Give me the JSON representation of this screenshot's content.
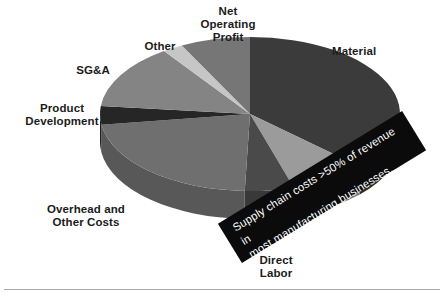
{
  "chart_data": {
    "type": "pie",
    "title": "",
    "style": "3d-pie",
    "callout": "Supply chain costs >50% of revenue in\nmost manufacturing businesses.",
    "categories": [
      "Material",
      "Direct Labor",
      "Overhead and Other Costs",
      "Product Development",
      "SG&A",
      "Other",
      "Net Operating Profit"
    ],
    "labels": {
      "material": "Material",
      "direct_labor": "Direct\nLabor",
      "overhead": "Overhead and\nOther Costs",
      "product_development": "Product\nDevelopment",
      "sga": "SG&A",
      "other": "Other",
      "net_operating_profit": "Net\nOperating\nProfit"
    },
    "slices": [
      {
        "name": "Material",
        "start_deg": 0,
        "end_deg": 133,
        "value": 36.9,
        "color": "#3b3b3b",
        "side_color": "#2b2b2b"
      },
      {
        "name": "Direct Labor",
        "start_deg": 133,
        "end_deg": 163,
        "value": 8.3,
        "color": "#9b9b9b",
        "side_color": "#7b7b7b"
      },
      {
        "name": "Overhead Wedge Dark",
        "start_deg": 163,
        "end_deg": 182,
        "value": 5.3,
        "color": "#4a4a4a",
        "side_color": "#393939"
      },
      {
        "name": "Overhead and Other Costs",
        "start_deg": 182,
        "end_deg": 262,
        "value": 22.2,
        "color": "#6f6f6f",
        "side_color": "#585858"
      },
      {
        "name": "Product Development",
        "start_deg": 262,
        "end_deg": 276,
        "value": 3.9,
        "color": "#262626",
        "side_color": "#1d1d1d"
      },
      {
        "name": "SG&A",
        "start_deg": 276,
        "end_deg": 325,
        "value": 13.6,
        "color": "#848484",
        "side_color": "#6a6a6a"
      },
      {
        "name": "Other",
        "start_deg": 325,
        "end_deg": 333,
        "value": 2.2,
        "color": "#c6c6c6",
        "side_color": "#9e9e9e"
      },
      {
        "name": "Net Operating Profit",
        "start_deg": 333,
        "end_deg": 360,
        "value": 7.5,
        "color": "#767676",
        "side_color": "#5e5e5e"
      }
    ],
    "geometry": {
      "cx": 250,
      "cy": 114,
      "rx": 150,
      "ry": 77,
      "depth": 28
    },
    "legend": "none",
    "grid": false
  },
  "figure": {
    "divider_color": "#a9a9a9"
  }
}
